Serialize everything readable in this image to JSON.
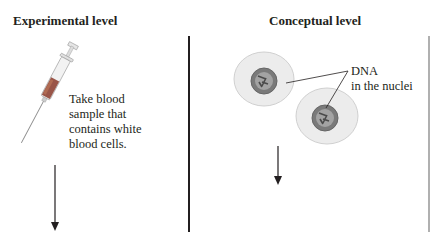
{
  "left_panel": {
    "heading": "Experimental level",
    "step_text": "Take blood\nsample that\ncontains white\nblood cells.",
    "icon": "syringe-icon"
  },
  "right_panel": {
    "heading": "Conceptual level",
    "callout_text": "DNA\nin the nuclei",
    "icon": "white-blood-cells-icon"
  },
  "colors": {
    "divider": "#231f20",
    "right_divider": "#b0b0b0",
    "blood": "#8a3a2a",
    "nucleus": "#6e6e6e",
    "cell": "#ececec"
  }
}
